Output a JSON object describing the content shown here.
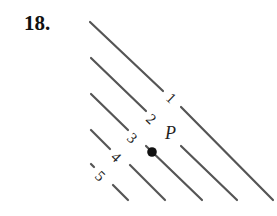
{
  "problem": {
    "number": "18."
  },
  "diagram": {
    "level_curves": [
      {
        "label": "1"
      },
      {
        "label": "2"
      },
      {
        "label": "3"
      },
      {
        "label": "4"
      },
      {
        "label": "5"
      }
    ],
    "point": {
      "label": "P"
    }
  }
}
